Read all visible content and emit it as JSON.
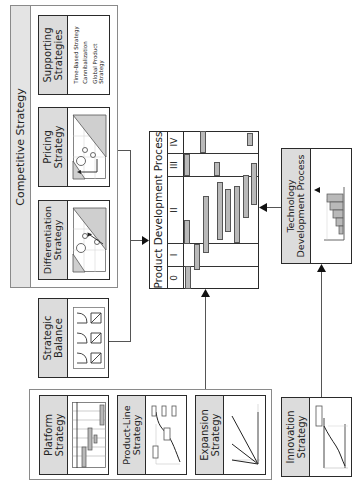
{
  "competitive_strategy": {
    "title": "Competitive Strategy",
    "boxes": [
      {
        "id": "supporting",
        "title_line1": "Supporting",
        "title_line2": "Strategies",
        "items": [
          "Time-Based Strategy",
          "Cannibalization",
          "Global Product",
          "Strategy"
        ]
      },
      {
        "id": "pricing",
        "title_line1": "Pricing",
        "title_line2": "Strategy"
      },
      {
        "id": "differentiation",
        "title_line1": "Differentiation",
        "title_line2": "Strategy"
      }
    ]
  },
  "strategic_balance": {
    "title_line1": "Strategic",
    "title_line2": "Balance"
  },
  "product_development_process": {
    "title": "Product Development Process",
    "phases": [
      "0",
      "I",
      "II",
      "III",
      "IV"
    ]
  },
  "technology_development_process": {
    "title_line1": "Technology",
    "title_line2": "Development Process"
  },
  "bottom_group": {
    "boxes": [
      {
        "id": "platform",
        "title_line1": "Platform",
        "title_line2": "Strategy"
      },
      {
        "id": "product_line",
        "title_line1": "Product-Line",
        "title_line2": "Strategy"
      },
      {
        "id": "expansion",
        "title_line1": "Expansion",
        "title_line2": "Strategy"
      }
    ]
  },
  "innovation_strategy": {
    "title_line1": "Innovation",
    "title_line2": "Strategy"
  },
  "colors": {
    "strip": "#dcdcdc",
    "bar": "#b9b9b9",
    "border": "#2a2a2a",
    "outer": "#8a8a8a"
  }
}
